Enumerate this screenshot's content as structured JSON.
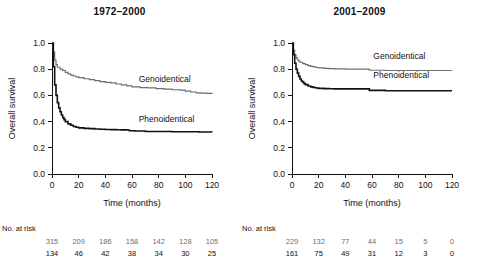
{
  "figure": {
    "width": 479,
    "height": 266,
    "background": "#ffffff"
  },
  "colors": {
    "genoidentical": "#6e6e6e",
    "phenoidentical": "#111111",
    "axis": "#111111"
  },
  "panels": [
    {
      "id": "left",
      "title": "1972–2000",
      "risk_heading": "No. at risk",
      "chart_data": {
        "type": "line",
        "title": "1972–2000",
        "xlabel": "Time (months)",
        "ylabel": "Overall survival",
        "xlim": [
          0,
          120
        ],
        "ylim": [
          0.0,
          1.0
        ],
        "xticks": [
          0,
          20,
          40,
          60,
          80,
          100,
          120
        ],
        "yticks": [
          "0.0",
          "0.2",
          "0.4",
          "0.6",
          "0.8",
          "1.0"
        ],
        "grid": false,
        "legend_position": "inline-right-of-curve",
        "series": [
          {
            "name": "Genoidentical",
            "color": "#6e6e6e",
            "label_x": 62,
            "label_y": 0.7,
            "points": [
              [
                0,
                1.0
              ],
              [
                1,
                0.93
              ],
              [
                2,
                0.87
              ],
              [
                3,
                0.835
              ],
              [
                4,
                0.815
              ],
              [
                6,
                0.8
              ],
              [
                8,
                0.79
              ],
              [
                10,
                0.775
              ],
              [
                12,
                0.765
              ],
              [
                14,
                0.755
              ],
              [
                16,
                0.748
              ],
              [
                18,
                0.742
              ],
              [
                20,
                0.736
              ],
              [
                24,
                0.727
              ],
              [
                28,
                0.72
              ],
              [
                32,
                0.713
              ],
              [
                36,
                0.705
              ],
              [
                40,
                0.7
              ],
              [
                44,
                0.695
              ],
              [
                48,
                0.687
              ],
              [
                52,
                0.68
              ],
              [
                56,
                0.672
              ],
              [
                60,
                0.665
              ],
              [
                66,
                0.66
              ],
              [
                72,
                0.657
              ],
              [
                78,
                0.652
              ],
              [
                84,
                0.648
              ],
              [
                90,
                0.643
              ],
              [
                96,
                0.64
              ],
              [
                100,
                0.632
              ],
              [
                104,
                0.626
              ],
              [
                108,
                0.62
              ],
              [
                112,
                0.617
              ],
              [
                116,
                0.615
              ],
              [
                120,
                0.613
              ]
            ]
          },
          {
            "name": "Phenoidentical",
            "color": "#111111",
            "label_x": 62,
            "label_y": 0.4,
            "points": [
              [
                0,
                1.0
              ],
              [
                1,
                0.82
              ],
              [
                2,
                0.68
              ],
              [
                3,
                0.6
              ],
              [
                4,
                0.545
              ],
              [
                5,
                0.505
              ],
              [
                6,
                0.475
              ],
              [
                7,
                0.45
              ],
              [
                8,
                0.43
              ],
              [
                9,
                0.415
              ],
              [
                10,
                0.4
              ],
              [
                12,
                0.383
              ],
              [
                14,
                0.372
              ],
              [
                16,
                0.363
              ],
              [
                18,
                0.357
              ],
              [
                20,
                0.352
              ],
              [
                24,
                0.348
              ],
              [
                28,
                0.346
              ],
              [
                32,
                0.344
              ],
              [
                36,
                0.342
              ],
              [
                40,
                0.34
              ],
              [
                44,
                0.339
              ],
              [
                48,
                0.338
              ],
              [
                52,
                0.337
              ],
              [
                56,
                0.336
              ],
              [
                58,
                0.33
              ],
              [
                62,
                0.328
              ],
              [
                70,
                0.325
              ],
              [
                80,
                0.324
              ],
              [
                90,
                0.323
              ],
              [
                100,
                0.322
              ],
              [
                110,
                0.321
              ],
              [
                120,
                0.32
              ]
            ]
          }
        ],
        "risk_table": {
          "times": [
            0,
            20,
            40,
            60,
            80,
            100,
            120
          ],
          "rows": [
            {
              "name": "Genoidentical",
              "values": [
                315,
                209,
                186,
                158,
                142,
                128,
                105
              ]
            },
            {
              "name": "Phenoidentical",
              "values": [
                134,
                46,
                42,
                38,
                34,
                30,
                25
              ]
            }
          ]
        }
      }
    },
    {
      "id": "right",
      "title": "2001–2009",
      "risk_heading": "No. at risk",
      "chart_data": {
        "type": "line",
        "title": "2001–2009",
        "xlabel": "Time (months)",
        "ylabel": "Overall survival",
        "xlim": [
          0,
          120
        ],
        "ylim": [
          0.0,
          1.0
        ],
        "xticks": [
          0,
          20,
          40,
          60,
          80,
          100,
          120
        ],
        "yticks": [
          "0.0",
          "0.2",
          "0.4",
          "0.6",
          "0.8",
          "1.0"
        ],
        "grid": false,
        "legend_position": "inline-right-of-curve",
        "series": [
          {
            "name": "Genoidentical",
            "color": "#6e6e6e",
            "label_x": 58,
            "label_y": 0.875,
            "points": [
              [
                0,
                1.0
              ],
              [
                1,
                0.945
              ],
              [
                2,
                0.91
              ],
              [
                3,
                0.888
              ],
              [
                4,
                0.872
              ],
              [
                5,
                0.862
              ],
              [
                6,
                0.853
              ],
              [
                8,
                0.843
              ],
              [
                10,
                0.835
              ],
              [
                12,
                0.828
              ],
              [
                14,
                0.822
              ],
              [
                16,
                0.817
              ],
              [
                18,
                0.813
              ],
              [
                20,
                0.81
              ],
              [
                24,
                0.807
              ],
              [
                28,
                0.805
              ],
              [
                32,
                0.803
              ],
              [
                36,
                0.802
              ],
              [
                40,
                0.801
              ],
              [
                44,
                0.8
              ],
              [
                48,
                0.8
              ],
              [
                52,
                0.8
              ],
              [
                56,
                0.8
              ],
              [
                58,
                0.792
              ],
              [
                70,
                0.79
              ],
              [
                85,
                0.79
              ],
              [
                100,
                0.79
              ],
              [
                110,
                0.79
              ],
              [
                120,
                0.79
              ]
            ]
          },
          {
            "name": "Phenoidentical",
            "color": "#111111",
            "label_x": 58,
            "label_y": 0.735,
            "points": [
              [
                0,
                1.0
              ],
              [
                1,
                0.91
              ],
              [
                2,
                0.845
              ],
              [
                3,
                0.8
              ],
              [
                4,
                0.77
              ],
              [
                5,
                0.745
              ],
              [
                6,
                0.725
              ],
              [
                7,
                0.71
              ],
              [
                8,
                0.7
              ],
              [
                9,
                0.69
              ],
              [
                10,
                0.682
              ],
              [
                12,
                0.672
              ],
              [
                14,
                0.665
              ],
              [
                16,
                0.66
              ],
              [
                18,
                0.657
              ],
              [
                20,
                0.654
              ],
              [
                24,
                0.652
              ],
              [
                28,
                0.651
              ],
              [
                32,
                0.65
              ],
              [
                36,
                0.65
              ],
              [
                40,
                0.65
              ],
              [
                44,
                0.65
              ],
              [
                48,
                0.65
              ],
              [
                52,
                0.65
              ],
              [
                56,
                0.65
              ],
              [
                58,
                0.638
              ],
              [
                70,
                0.635
              ],
              [
                85,
                0.635
              ],
              [
                100,
                0.635
              ],
              [
                110,
                0.635
              ],
              [
                120,
                0.635
              ]
            ]
          }
        ],
        "risk_table": {
          "times": [
            0,
            20,
            40,
            60,
            80,
            100,
            120
          ],
          "rows": [
            {
              "name": "Genoidentical",
              "values": [
                229,
                132,
                77,
                44,
                15,
                5,
                0
              ]
            },
            {
              "name": "Phenoidentical",
              "values": [
                161,
                75,
                49,
                31,
                12,
                3,
                0
              ]
            }
          ]
        }
      }
    }
  ]
}
